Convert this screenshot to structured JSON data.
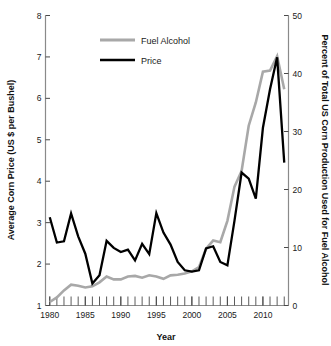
{
  "chart_data": {
    "type": "line",
    "title": "",
    "xlabel": "Year",
    "ylabel": "Average Corn Price (US $ per Bushel)",
    "ylabel_right": "Percent of Total US Corn Production Used for Fuel Alcohol",
    "xlim": [
      1979.4,
      2013.6
    ],
    "ylim": [
      1,
      8
    ],
    "ylim_right": [
      0,
      50
    ],
    "grid": false,
    "legend_position": "top-center",
    "x_ticks_major": [
      1980,
      1985,
      1990,
      1995,
      2000,
      2005,
      2010
    ],
    "x_tick_labels": [
      "1980",
      "1985",
      "1990",
      "1995",
      "2000",
      "2005",
      "2010"
    ],
    "x_ticks_minor_step": 1,
    "y_ticks_left": [
      1,
      2,
      3,
      4,
      5,
      6,
      7,
      8
    ],
    "y_tick_labels_left": [
      "1",
      "2",
      "3",
      "4",
      "5",
      "6",
      "7",
      "8"
    ],
    "y_ticks_right": [
      0,
      10,
      20,
      30,
      40,
      50
    ],
    "y_tick_labels_right": [
      "0",
      "10",
      "20",
      "30",
      "40",
      "50"
    ],
    "series": [
      {
        "name": "Fuel Alcohol",
        "axis": "right",
        "color": "#a8a8a8",
        "width": 2.6,
        "unit": "percent",
        "x": [
          1980,
          1981,
          1982,
          1983,
          1984,
          1985,
          1986,
          1987,
          1988,
          1989,
          1990,
          1991,
          1992,
          1993,
          1994,
          1995,
          1996,
          1997,
          1998,
          1999,
          2000,
          2001,
          2002,
          2003,
          2004,
          2005,
          2006,
          2007,
          2008,
          2009,
          2010,
          2011,
          2012,
          2013
        ],
        "values": [
          0.6,
          1.4,
          2.6,
          3.6,
          3.4,
          3.1,
          3.3,
          4.0,
          5.0,
          4.5,
          4.5,
          5.0,
          5.1,
          4.8,
          5.2,
          5.0,
          4.6,
          5.2,
          5.3,
          5.5,
          5.9,
          6.6,
          9.8,
          11.2,
          10.9,
          14.6,
          20.5,
          23.2,
          31.0,
          35.0,
          40.3,
          40.5,
          43.0,
          37.3
        ]
      },
      {
        "name": "Price",
        "axis": "left",
        "color": "#000000",
        "width": 2.3,
        "unit": "usd_per_bushel",
        "x": [
          1980,
          1981,
          1982,
          1983,
          1984,
          1985,
          1986,
          1987,
          1988,
          1989,
          1990,
          1991,
          1992,
          1993,
          1994,
          1995,
          1996,
          1997,
          1998,
          1999,
          2000,
          2001,
          2002,
          2003,
          2004,
          2005,
          2006,
          2007,
          2008,
          2009,
          2010,
          2011,
          2012,
          2013
        ],
        "values": [
          3.13,
          2.52,
          2.55,
          3.22,
          2.67,
          2.25,
          1.53,
          1.73,
          2.56,
          2.39,
          2.29,
          2.35,
          2.09,
          2.49,
          2.24,
          3.23,
          2.76,
          2.47,
          2.05,
          1.85,
          1.82,
          1.85,
          2.38,
          2.43,
          2.05,
          1.97,
          3.05,
          4.21,
          4.06,
          3.58,
          5.29,
          6.22,
          6.99,
          4.45
        ]
      }
    ],
    "annotations": []
  },
  "legend": {
    "items": [
      {
        "label": "Fuel Alcohol",
        "color": "#a8a8a8"
      },
      {
        "label": "Price",
        "color": "#000000"
      }
    ]
  },
  "colors": {
    "fuel_alcohol": "#a8a8a8",
    "price": "#000000",
    "axis": "#8a8a8a",
    "text": "#1a1a1a",
    "background": "#ffffff"
  }
}
